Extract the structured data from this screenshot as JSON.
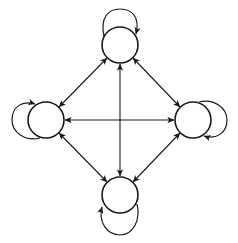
{
  "diagram": {
    "type": "directed-graph",
    "colors": {
      "stroke": "#1a1a1a",
      "background": "#ffffff",
      "node_fill": "#ffffff"
    },
    "nodes": [
      {
        "id": "top",
        "label": "",
        "cx": 120,
        "cy": 45,
        "r": 18
      },
      {
        "id": "left",
        "label": "",
        "cx": 46,
        "cy": 120,
        "r": 18
      },
      {
        "id": "right",
        "label": "",
        "cx": 193,
        "cy": 120,
        "r": 18
      },
      {
        "id": "bottom",
        "label": "",
        "cx": 120,
        "cy": 195,
        "r": 18
      }
    ],
    "edges": [
      {
        "from": "top",
        "to": "left",
        "bidirectional": true
      },
      {
        "from": "top",
        "to": "right",
        "bidirectional": true
      },
      {
        "from": "top",
        "to": "bottom",
        "bidirectional": true
      },
      {
        "from": "left",
        "to": "right",
        "bidirectional": true
      },
      {
        "from": "left",
        "to": "bottom",
        "bidirectional": true
      },
      {
        "from": "right",
        "to": "bottom",
        "bidirectional": true
      }
    ],
    "self_loops": [
      {
        "node": "top",
        "side": "top"
      },
      {
        "node": "left",
        "side": "left"
      },
      {
        "node": "right",
        "side": "right"
      },
      {
        "node": "bottom",
        "side": "bottom"
      }
    ]
  }
}
